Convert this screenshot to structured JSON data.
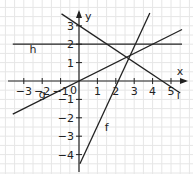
{
  "chart_data": {
    "type": "line",
    "title": "",
    "xlabel": "x",
    "ylabel": "y",
    "xlim": [
      -3.6,
      5.6
    ],
    "ylim": [
      -4.5,
      3.6
    ],
    "grid": true,
    "x_ticks": [
      -3,
      -2,
      -1,
      1,
      2,
      3,
      4,
      5
    ],
    "y_ticks": [
      -4,
      -3,
      -2,
      -1,
      1,
      2,
      3
    ],
    "origin_label": "0",
    "series": [
      {
        "name": "h",
        "equation": "y = 2",
        "points": [
          [
            -3.6,
            2
          ],
          [
            5.6,
            2
          ]
        ],
        "label_pos": [
          -2.5,
          1.5
        ]
      },
      {
        "name": "f",
        "equation": "y = 2x - 4",
        "points": [
          [
            0.05,
            -4.5
          ],
          [
            3.85,
            3.7
          ]
        ],
        "label_pos": [
          1.5,
          -2.7
        ]
      },
      {
        "name": "g",
        "equation": "y = 0.5x",
        "points": [
          [
            -3.6,
            -1.8
          ],
          [
            5.6,
            2.8
          ]
        ],
        "label_pos": [
          -2.0,
          -0.9
        ]
      },
      {
        "name": "i",
        "equation": "y = -2/3 x + 3",
        "points": [
          [
            -0.95,
            3.65
          ],
          [
            5.5,
            -0.65
          ]
        ],
        "label_pos": [
          5.4,
          -1.0
        ]
      }
    ]
  },
  "colors": {
    "line": "#222222",
    "grid": "#e6e6e6",
    "axis": "#222222"
  }
}
